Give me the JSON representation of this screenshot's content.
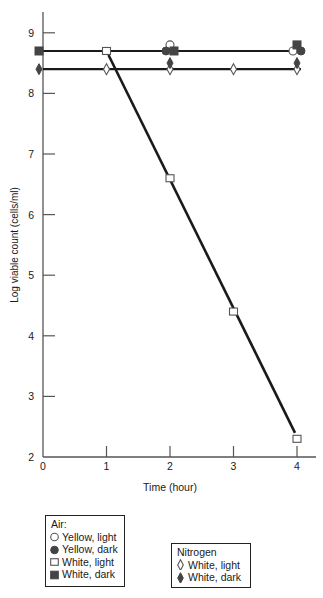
{
  "chart_data": {
    "type": "line",
    "title": "",
    "xlabel": "Time (hour)",
    "ylabel": "Log viable count (cells/ml)",
    "xlim": [
      0,
      4
    ],
    "ylim": [
      2,
      9.4
    ],
    "x_ticks": [
      0,
      1,
      2,
      3,
      4
    ],
    "y_ticks": [
      2,
      3,
      4,
      5,
      6,
      7,
      8,
      9
    ],
    "grid": false,
    "legend_position": "below",
    "series": [
      {
        "name": "Yellow, light",
        "group": "Air",
        "marker": "open-circle",
        "x": [
          2,
          4
        ],
        "y": [
          8.8,
          8.7
        ]
      },
      {
        "name": "Yellow, dark",
        "group": "Air",
        "marker": "filled-circle",
        "x": [
          2,
          4
        ],
        "y": [
          8.7,
          8.7
        ]
      },
      {
        "name": "White, light",
        "group": "Air",
        "marker": "open-square",
        "x": [
          1,
          2,
          3,
          4
        ],
        "y": [
          8.7,
          6.6,
          4.4,
          2.3
        ]
      },
      {
        "name": "White, dark",
        "group": "Air",
        "marker": "filled-square",
        "x": [
          0,
          2,
          4
        ],
        "y": [
          8.7,
          8.7,
          8.8
        ]
      },
      {
        "name": "White, light",
        "group": "Nitrogen",
        "marker": "open-diamond",
        "x": [
          1,
          2,
          3,
          4
        ],
        "y": [
          8.4,
          8.4,
          8.4,
          8.4
        ]
      },
      {
        "name": "White, dark",
        "group": "Nitrogen",
        "marker": "filled-diamond",
        "x": [
          0,
          2,
          4
        ],
        "y": [
          8.4,
          8.5,
          8.5
        ]
      }
    ],
    "fitted_lines": [
      {
        "description": "horizontal line",
        "x": [
          0,
          4
        ],
        "y": [
          8.7,
          8.7
        ]
      },
      {
        "description": "horizontal line",
        "x": [
          0,
          4
        ],
        "y": [
          8.4,
          8.4
        ]
      },
      {
        "description": "decline line (Air, White, light)",
        "x": [
          1,
          4
        ],
        "y": [
          8.7,
          2.3
        ]
      }
    ]
  },
  "legend": {
    "air": {
      "title": "Air:",
      "items": [
        {
          "label": "Yellow, light",
          "marker": "open-circle"
        },
        {
          "label": "Yellow, dark",
          "marker": "filled-circle"
        },
        {
          "label": "White, light",
          "marker": "open-square"
        },
        {
          "label": "White, dark",
          "marker": "filled-square"
        }
      ]
    },
    "nitrogen": {
      "title": "Nitrogen",
      "items": [
        {
          "label": "White, light",
          "marker": "open-diamond"
        },
        {
          "label": "White, dark",
          "marker": "filled-diamond"
        }
      ]
    }
  },
  "colors": {
    "ink": "#1a1a1a",
    "marker_stroke": "#555555",
    "marker_fill": "#444444"
  }
}
